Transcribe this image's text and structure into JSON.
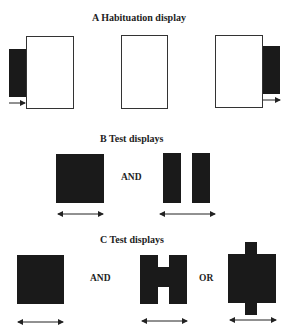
{
  "sections": {
    "a": {
      "title": "A  Habituation display"
    },
    "b": {
      "title": "B  Test displays",
      "conjunction": "AND"
    },
    "c": {
      "title": "C  Test displays",
      "conjunction_1": "AND",
      "conjunction_2": "OR"
    }
  },
  "colors": {
    "shape_fill": "#1a1a1a",
    "outline": "#333333",
    "background": "#ffffff"
  }
}
